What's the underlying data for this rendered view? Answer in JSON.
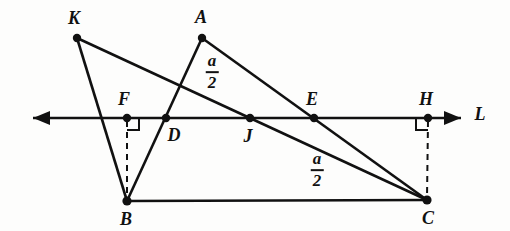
{
  "figure": {
    "kind": "euclidean-geometry-diagram",
    "stroke_color": "#111111",
    "background_color": "#fdfdfc",
    "canvas": {
      "width": 510,
      "height": 231
    }
  },
  "points": [
    {
      "id": "K",
      "label": "K",
      "x": 77,
      "y": 38,
      "label_x": 74,
      "label_y": 18,
      "dot": true
    },
    {
      "id": "A",
      "label": "A",
      "x": 202,
      "y": 38,
      "label_x": 201,
      "label_y": 17,
      "dot": true
    },
    {
      "id": "F",
      "label": "F",
      "x": 127,
      "y": 118,
      "label_x": 124,
      "label_y": 99,
      "dot": true
    },
    {
      "id": "D",
      "label": "D",
      "x": 166,
      "y": 118,
      "label_x": 174,
      "label_y": 135,
      "dot": true
    },
    {
      "id": "J",
      "label": "J",
      "x": 250,
      "y": 118,
      "label_x": 248,
      "label_y": 136,
      "dot": true
    },
    {
      "id": "E",
      "label": "E",
      "x": 314,
      "y": 118,
      "label_x": 312,
      "label_y": 99,
      "dot": true
    },
    {
      "id": "H",
      "label": "H",
      "x": 428,
      "y": 118,
      "label_x": 426,
      "label_y": 99,
      "dot": true
    },
    {
      "id": "B",
      "label": "B",
      "x": 127,
      "y": 201,
      "label_x": 126,
      "label_y": 219,
      "dot": true
    },
    {
      "id": "C",
      "label": "C",
      "x": 427,
      "y": 200,
      "label_x": 428,
      "label_y": 218,
      "dot": true
    }
  ],
  "line_label": {
    "text": "L",
    "x": 480,
    "y": 114
  },
  "segments": [
    {
      "name": "segment-K-B",
      "from": "K",
      "to": "B",
      "style": "solid",
      "width": 2.6
    },
    {
      "name": "segment-K-C",
      "from": "K",
      "to": "C",
      "style": "solid",
      "width": 2.6
    },
    {
      "name": "segment-A-B",
      "from": "A",
      "to": "B",
      "style": "solid",
      "width": 2.6
    },
    {
      "name": "segment-A-C",
      "from": "A",
      "to": "C",
      "style": "solid",
      "width": 2.6
    },
    {
      "name": "segment-B-C",
      "from": "B",
      "to": "C",
      "style": "solid",
      "width": 2.4
    },
    {
      "name": "segment-F-B",
      "from": "F",
      "to": "B",
      "style": "dashed",
      "width": 2.0
    },
    {
      "name": "segment-H-C",
      "from": "H",
      "to": "C",
      "style": "dashed",
      "width": 2.0
    }
  ],
  "transversal": {
    "name": "line-L",
    "y": 118,
    "x_start": 33,
    "x_end": 461,
    "arrow_left": true,
    "arrow_right": true,
    "width": 2.4
  },
  "right_angles": [
    {
      "name": "right-angle-at-F",
      "at": "F",
      "direction": "right-down",
      "size": 12
    },
    {
      "name": "right-angle-at-H",
      "at": "H",
      "direction": "left-down",
      "size": 12
    }
  ],
  "measure_labels": [
    {
      "id": "upper",
      "numerator": "a",
      "denominator": "2",
      "x": 212,
      "y": 72
    },
    {
      "id": "lower",
      "numerator": "a",
      "denominator": "2",
      "x": 317,
      "y": 170
    }
  ]
}
